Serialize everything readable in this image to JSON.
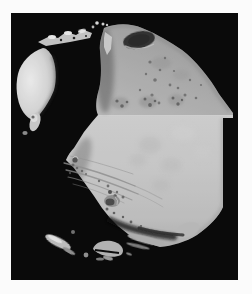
{
  "figure": {
    "name": "phobos-photograph",
    "alt": "Grayscale spacecraft mosaic photograph of Phobos, the irregular cratered moon of Mars, shown against black space with a large shadowed crater, parallel surface grooves, and a straight mosaic frame edge on the right",
    "colors": {
      "page_background": "#fbfbfb",
      "space_background": "#0a0a0a",
      "upper_terrain_gray": "#a4a4a4",
      "lower_mosaic_gray": "#c6c6c6",
      "limb_highlight": "#ececec",
      "crater_shadow": "#141414"
    }
  }
}
